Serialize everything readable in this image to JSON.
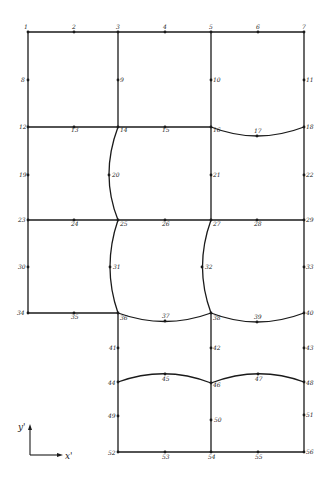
{
  "diagram": {
    "type": "finite-element-mesh",
    "stroke_color": "#1a1a1a",
    "nodes": [
      {
        "id": "1",
        "x": 28,
        "y": 32,
        "lx": 24,
        "ly": 29
      },
      {
        "id": "2",
        "x": 74,
        "y": 32,
        "lx": 72,
        "ly": 29
      },
      {
        "id": "3",
        "x": 118,
        "y": 32,
        "lx": 116,
        "ly": 29
      },
      {
        "id": "4",
        "x": 165,
        "y": 32,
        "lx": 163,
        "ly": 29
      },
      {
        "id": "5",
        "x": 211,
        "y": 32,
        "lx": 209,
        "ly": 29
      },
      {
        "id": "6",
        "x": 258,
        "y": 32,
        "lx": 256,
        "ly": 29
      },
      {
        "id": "7",
        "x": 304,
        "y": 32,
        "lx": 302,
        "ly": 29
      },
      {
        "id": "8",
        "x": 28,
        "y": 80,
        "lx": 21,
        "ly": 82
      },
      {
        "id": "9",
        "x": 118,
        "y": 80,
        "lx": 120,
        "ly": 82
      },
      {
        "id": "10",
        "x": 211,
        "y": 80,
        "lx": 213,
        "ly": 82
      },
      {
        "id": "11",
        "x": 304,
        "y": 80,
        "lx": 306,
        "ly": 82
      },
      {
        "id": "12",
        "x": 28,
        "y": 127,
        "lx": 19,
        "ly": 129
      },
      {
        "id": "13",
        "x": 74,
        "y": 127,
        "lx": 71,
        "ly": 132
      },
      {
        "id": "14",
        "x": 118,
        "y": 127,
        "lx": 120,
        "ly": 132
      },
      {
        "id": "15",
        "x": 165,
        "y": 127,
        "lx": 162,
        "ly": 132
      },
      {
        "id": "16",
        "x": 211,
        "y": 127,
        "lx": 213,
        "ly": 132
      },
      {
        "id": "17",
        "x": 257,
        "y": 136,
        "lx": 254,
        "ly": 133
      },
      {
        "id": "18",
        "x": 304,
        "y": 127,
        "lx": 306,
        "ly": 129
      },
      {
        "id": "19",
        "x": 28,
        "y": 175,
        "lx": 19,
        "ly": 177
      },
      {
        "id": "20",
        "x": 109,
        "y": 175,
        "lx": 112,
        "ly": 177
      },
      {
        "id": "21",
        "x": 211,
        "y": 175,
        "lx": 213,
        "ly": 177
      },
      {
        "id": "22",
        "x": 304,
        "y": 175,
        "lx": 306,
        "ly": 177
      },
      {
        "id": "23",
        "x": 28,
        "y": 220,
        "lx": 18,
        "ly": 222
      },
      {
        "id": "24",
        "x": 74,
        "y": 220,
        "lx": 71,
        "ly": 226
      },
      {
        "id": "25",
        "x": 118,
        "y": 220,
        "lx": 120,
        "ly": 226
      },
      {
        "id": "26",
        "x": 165,
        "y": 220,
        "lx": 162,
        "ly": 226
      },
      {
        "id": "27",
        "x": 211,
        "y": 220,
        "lx": 213,
        "ly": 226
      },
      {
        "id": "28",
        "x": 257,
        "y": 220,
        "lx": 254,
        "ly": 226
      },
      {
        "id": "29",
        "x": 304,
        "y": 220,
        "lx": 306,
        "ly": 222
      },
      {
        "id": "30",
        "x": 28,
        "y": 267,
        "lx": 18,
        "ly": 269
      },
      {
        "id": "31",
        "x": 110,
        "y": 267,
        "lx": 113,
        "ly": 269
      },
      {
        "id": "32",
        "x": 202,
        "y": 267,
        "lx": 205,
        "ly": 269
      },
      {
        "id": "33",
        "x": 304,
        "y": 267,
        "lx": 306,
        "ly": 269
      },
      {
        "id": "34",
        "x": 28,
        "y": 313,
        "lx": 17,
        "ly": 315
      },
      {
        "id": "35",
        "x": 74,
        "y": 313,
        "lx": 71,
        "ly": 319
      },
      {
        "id": "36",
        "x": 118,
        "y": 313,
        "lx": 120,
        "ly": 320
      },
      {
        "id": "37",
        "x": 165,
        "y": 321,
        "lx": 162,
        "ly": 318
      },
      {
        "id": "38",
        "x": 211,
        "y": 313,
        "lx": 213,
        "ly": 320
      },
      {
        "id": "39",
        "x": 257,
        "y": 322,
        "lx": 254,
        "ly": 319
      },
      {
        "id": "40",
        "x": 304,
        "y": 313,
        "lx": 306,
        "ly": 315
      },
      {
        "id": "41",
        "x": 118,
        "y": 348,
        "lx": 109,
        "ly": 350
      },
      {
        "id": "42",
        "x": 211,
        "y": 348,
        "lx": 213,
        "ly": 350
      },
      {
        "id": "43",
        "x": 304,
        "y": 348,
        "lx": 306,
        "ly": 350
      },
      {
        "id": "44",
        "x": 118,
        "y": 382,
        "lx": 108,
        "ly": 385
      },
      {
        "id": "45",
        "x": 165,
        "y": 374,
        "lx": 162,
        "ly": 381
      },
      {
        "id": "46",
        "x": 211,
        "y": 383,
        "lx": 213,
        "ly": 387
      },
      {
        "id": "47",
        "x": 258,
        "y": 374,
        "lx": 255,
        "ly": 381
      },
      {
        "id": "48",
        "x": 304,
        "y": 382,
        "lx": 306,
        "ly": 385
      },
      {
        "id": "49",
        "x": 118,
        "y": 416,
        "lx": 108,
        "ly": 418
      },
      {
        "id": "50",
        "x": 211,
        "y": 420,
        "lx": 214,
        "ly": 422
      },
      {
        "id": "51",
        "x": 304,
        "y": 415,
        "lx": 306,
        "ly": 417
      },
      {
        "id": "52",
        "x": 118,
        "y": 452,
        "lx": 108,
        "ly": 455
      },
      {
        "id": "53",
        "x": 165,
        "y": 452,
        "lx": 162,
        "ly": 459
      },
      {
        "id": "54",
        "x": 211,
        "y": 452,
        "lx": 208,
        "ly": 459
      },
      {
        "id": "55",
        "x": 258,
        "y": 452,
        "lx": 255,
        "ly": 459
      },
      {
        "id": "56",
        "x": 304,
        "y": 452,
        "lx": 306,
        "ly": 454
      }
    ],
    "axes": {
      "x_label": "x'",
      "y_label": "y'"
    }
  }
}
